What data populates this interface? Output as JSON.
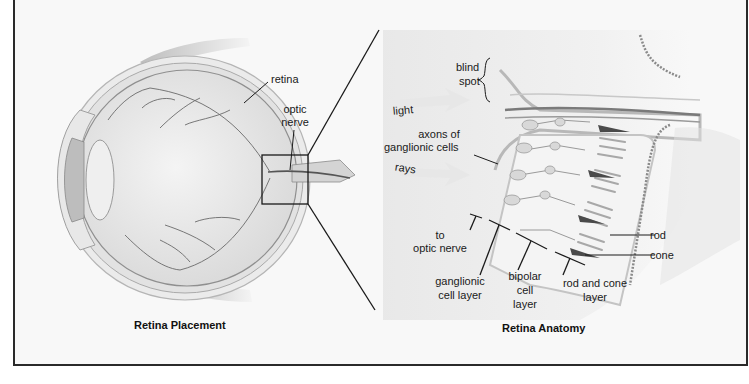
{
  "panels": {
    "left": {
      "caption": "Retina Placement",
      "labels": {
        "retina": "retina",
        "optic_nerve_line1": "optic",
        "optic_nerve_line2": "nerve"
      }
    },
    "right": {
      "caption": "Retina Anatomy",
      "labels": {
        "blind_spot_line1": "blind",
        "blind_spot_line2": "spot",
        "light": "light",
        "rays": "rays",
        "axons_line1": "axons of",
        "axons_line2": "ganglionic cells",
        "to_optic_line1": "to",
        "to_optic_line2": "optic nerve",
        "ganglionic_line1": "ganglionic",
        "ganglionic_line2": "cell layer",
        "bipolar_line1": "bipolar",
        "bipolar_line2": "cell",
        "bipolar_line3": "layer",
        "rodcone_line1": "rod and cone",
        "rodcone_line2": "layer",
        "rod": "rod",
        "cone": "cone"
      }
    }
  },
  "colors": {
    "frame": "#2a2a2a",
    "background": "#f8f8f8",
    "tissue": "#d8d8d8",
    "vessel": "#6a6a6a",
    "dark_cell": "#4a4a4a"
  }
}
